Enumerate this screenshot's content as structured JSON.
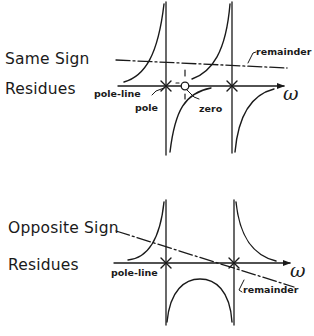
{
  "diagrams": [
    {
      "title_line1": "Same Sign",
      "title_line2": "Residues",
      "labels": {
        "pole_line": "pole-line",
        "pole": "pole",
        "zero": "zero",
        "remainder": "remainder R",
        "axis": "ω"
      }
    },
    {
      "title_line1": "Opposite Sign",
      "title_line2": "Residues",
      "labels": {
        "pole_line": "pole-line",
        "remainder": "remainder",
        "axis": "ω"
      }
    }
  ],
  "colors": {
    "ink": "#1a1a1a",
    "background": "#ffffff"
  }
}
